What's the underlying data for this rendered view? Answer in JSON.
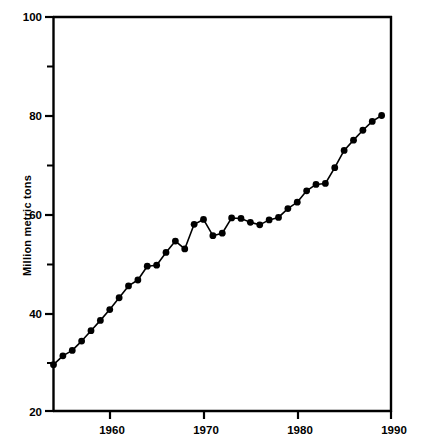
{
  "chart_data": {
    "type": "line",
    "title": "",
    "subtitle": "",
    "xlabel": "",
    "ylabel": "Million metric tons",
    "xlim": [
      1954,
      1990
    ],
    "ylim": [
      20,
      100
    ],
    "grid": false,
    "legend": null,
    "marker": "filled-circle",
    "x_ticks_major": [
      1960,
      1970,
      1980,
      1990
    ],
    "x_tick_labels": [
      "1960",
      "1970",
      "1980",
      "1990"
    ],
    "y_ticks_major": [
      20,
      40,
      60,
      80,
      100
    ],
    "y_tick_labels": [
      "20",
      "40",
      "60",
      "80",
      "100"
    ],
    "y_ticks_minor": [
      30,
      50,
      70,
      90
    ],
    "series": [
      {
        "name": "Million metric tons",
        "x": [
          1954,
          1955,
          1956,
          1957,
          1958,
          1959,
          1960,
          1961,
          1962,
          1963,
          1964,
          1965,
          1966,
          1967,
          1968,
          1969,
          1970,
          1971,
          1972,
          1973,
          1974,
          1975,
          1976,
          1977,
          1978,
          1979,
          1980,
          1981,
          1982,
          1983,
          1984,
          1985,
          1986,
          1987,
          1988,
          1989
        ],
        "values": [
          29.4,
          31.2,
          32.3,
          34.2,
          36.3,
          38.4,
          40.6,
          43.0,
          45.4,
          46.6,
          49.4,
          49.6,
          52.2,
          54.5,
          52.9,
          57.9,
          58.9,
          55.6,
          56.1,
          59.2,
          59.1,
          58.3,
          57.8,
          58.8,
          59.3,
          61.1,
          62.4,
          64.7,
          66.0,
          66.2,
          69.4,
          72.9,
          75.0,
          77.0,
          78.8,
          80.0
        ]
      }
    ]
  },
  "axis": {
    "y_label": "Million metric tons",
    "y_tick_100": "100",
    "y_tick_80": "80",
    "y_tick_60": "60",
    "y_tick_40": "40",
    "y_tick_20": "20",
    "x_tick_1960": "1960",
    "x_tick_1970": "1970",
    "x_tick_1980": "1980",
    "x_tick_1990": "1990"
  },
  "colors": {
    "line": "#000000",
    "marker": "#000000",
    "axis": "#000000",
    "background": "#ffffff"
  }
}
